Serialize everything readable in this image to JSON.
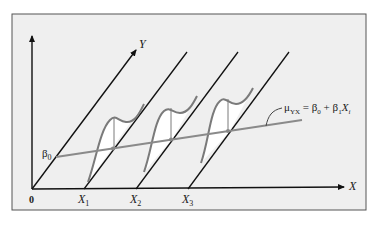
{
  "figure": {
    "type": "regression-model-diagram",
    "frame_bg": "#efefef",
    "axis_color": "#111111",
    "regression_line_color": "#8a8a8a",
    "curve_color": "#7a7a7a",
    "labels": {
      "y_axis": "Y",
      "x_axis": "X",
      "origin": "0",
      "intercept": "β",
      "intercept_sub": "0",
      "x_ticks": [
        {
          "base": "X",
          "sub": "1"
        },
        {
          "base": "X",
          "sub": "2"
        },
        {
          "base": "X",
          "sub": "3"
        }
      ],
      "equation": {
        "mu": "μ",
        "mu_sub": "YX",
        "rhs_1": " = β",
        "rhs_1_sub": "0",
        "rhs_2": " + β",
        "rhs_2_sub": "1",
        "rhs_3": "X",
        "rhs_3_sub": "i"
      }
    }
  }
}
